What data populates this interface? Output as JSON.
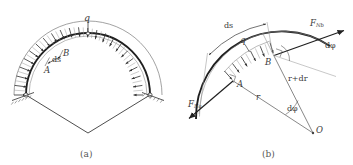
{
  "figure": {
    "background": "#ffffff",
    "line_color": "#4a4a4a",
    "thick_line_color": "#1f1f1f",
    "label_color": "#3a3a3a"
  },
  "panel_a": {
    "caption": "(a)",
    "load_label": "q",
    "point_a": "A",
    "point_b": "B",
    "ds_label": "ds",
    "support_left": "pin-support",
    "support_right": "pin-support",
    "arrow_count": 19,
    "description": "Semicircular arch loaded by uniform radial pressure q, hinged at both ends, with radii drawn to the centre."
  },
  "panel_b": {
    "caption": "(b)",
    "load_label": "q",
    "point_a": "A",
    "point_b": "B",
    "point_o": "O",
    "ds_label": "ds",
    "force_a_main": "F",
    "force_a_sub": "Na",
    "force_b_main": "F",
    "force_b_sub": "Nb",
    "radius_label": "r",
    "radius_plus_label": "r+dr",
    "angle_label_top": "dφ",
    "angle_label_bottom": "dφ",
    "arrow_count": 6,
    "description": "Free-body diagram of arch element AB: radial load q, normal forces F_Na and F_Nb tangent to the arch, radii r and r+dr from centre O subtending angle d-phi."
  }
}
